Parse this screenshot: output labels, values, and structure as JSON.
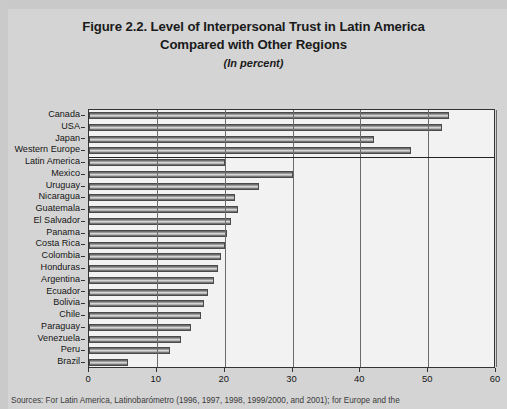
{
  "figure": {
    "title_line1": "Figure 2.2.  Level of Interpersonal Trust in Latin America",
    "title_line2": "Compared with Other Regions",
    "subtitle": "(In percent)",
    "source_note": "Sources: For Latin America, Latinobarómetro (1996, 1997, 1998, 1999/2000, and 2001); for Europe and the"
  },
  "chart_data": {
    "type": "bar",
    "orientation": "horizontal",
    "title": "Figure 2.2.  Level of Interpersonal Trust in Latin America Compared with Other Regions",
    "subtitle": "(In percent)",
    "xlabel": "",
    "ylabel": "",
    "xlim": [
      0,
      60
    ],
    "xticks": [
      0,
      10,
      20,
      30,
      40,
      50,
      60
    ],
    "xtick_labels": [
      "0",
      "10",
      "20",
      "30",
      "40",
      "50",
      "60"
    ],
    "grid": true,
    "legend": null,
    "separator_after_category": "Western Europe",
    "categories": [
      "Canada",
      "USA",
      "Japan",
      "Western Europe",
      "Latin America",
      "Mexico",
      "Uruguay",
      "Nicaragua",
      "Guatemala",
      "El Salvador",
      "Panama",
      "Costa Rica",
      "Colombia",
      "Honduras",
      "Argentina",
      "Ecuador",
      "Bolivia",
      "Chile",
      "Paraguay",
      "Venezuela",
      "Peru",
      "Brazil"
    ],
    "values": [
      53.0,
      52.0,
      42.0,
      47.5,
      20.0,
      30.0,
      25.0,
      21.5,
      22.0,
      21.0,
      20.3,
      20.0,
      19.5,
      19.0,
      18.5,
      17.5,
      17.0,
      16.5,
      15.0,
      13.5,
      12.0,
      5.8
    ]
  }
}
